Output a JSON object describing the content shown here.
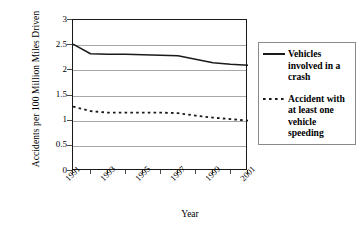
{
  "chart_data": {
    "type": "line",
    "title": "",
    "xlabel": "Year",
    "ylabel": "Accidents per 100 Million Miles Driven",
    "x": [
      1991,
      1992,
      1993,
      1994,
      1995,
      1996,
      1997,
      1998,
      1999,
      2000,
      2001
    ],
    "xtick_labels": [
      "1991",
      "1993",
      "1995",
      "1997",
      "1999",
      "2001"
    ],
    "xtick_label_years": [
      1991,
      1993,
      1995,
      1997,
      1999,
      2001
    ],
    "ytick_labels": [
      "0",
      "0.5",
      "1",
      "1.5",
      "2",
      "2.5",
      "3"
    ],
    "ytick_values": [
      0,
      0.5,
      1,
      1.5,
      2,
      2.5,
      3
    ],
    "ylim": [
      0,
      3
    ],
    "xlim": [
      1991,
      2001
    ],
    "grid": "horizontal",
    "legend_position": "right",
    "series": [
      {
        "name": "Vehicles involved in a crash",
        "style": "solid",
        "color": "#1a1a1a",
        "values": [
          2.52,
          2.33,
          2.32,
          2.32,
          2.31,
          2.3,
          2.29,
          2.22,
          2.15,
          2.12,
          2.1
        ]
      },
      {
        "name": "Accident with at least one vehicle speeding",
        "style": "dashed",
        "color": "#1a1a1a",
        "values": [
          1.28,
          1.19,
          1.16,
          1.16,
          1.16,
          1.16,
          1.15,
          1.1,
          1.06,
          1.03,
          1.0
        ]
      }
    ]
  },
  "legend": {
    "entries": [
      {
        "label": "Vehicles involved in a crash",
        "swatch": "solid-line-swatch"
      },
      {
        "label": "Accident with at least one vehicle speeding",
        "swatch": "dashed-line-swatch"
      }
    ]
  }
}
